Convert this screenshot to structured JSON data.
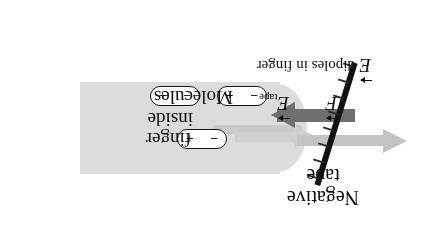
{
  "figure": {
    "background_color": "#ffffff",
    "rotation_note": "diagram rendered upside-down (180 degrees)"
  },
  "labels": {
    "negative_tape_line1": "Negative",
    "negative_tape_line2": "tape",
    "molecules": "Molecules",
    "inside": "inside",
    "finger": "finger",
    "dipoles_in_finger": "dipoles in finger"
  },
  "vectors": [
    {
      "id": "E-tape",
      "symbol": "E",
      "subscript": "tape",
      "direction": "toward finger",
      "color": "#0d0d0d"
    },
    {
      "id": "F",
      "symbol": "F",
      "subscript": "",
      "direction": "toward tape",
      "color": "#0d0d0d"
    },
    {
      "id": "E-dipoles",
      "symbol": "E",
      "subscript": "dipoles in finger",
      "direction": "toward tape",
      "color": "#0d0d0d"
    }
  ],
  "arrows": [
    {
      "id": "force-arrow",
      "color": "#6f6f6f",
      "direction": "left"
    },
    {
      "id": "field-arrow-tape",
      "color": "#c3c3c3",
      "direction": "right"
    },
    {
      "id": "field-arrow-finger",
      "color": "#cfcfcf",
      "direction": "right"
    }
  ],
  "tape": {
    "color": "#121212",
    "charge_symbol": "−",
    "charge_count": 8
  },
  "dipoles": {
    "count": 3,
    "negative_symbol": "−",
    "positive_symbol": "+",
    "outline_color": "#111111",
    "items": [
      {
        "id": "dipole-1"
      },
      {
        "id": "dipole-2"
      },
      {
        "id": "dipole-3"
      }
    ]
  },
  "finger": {
    "fill_color": "#dcdcdc"
  }
}
